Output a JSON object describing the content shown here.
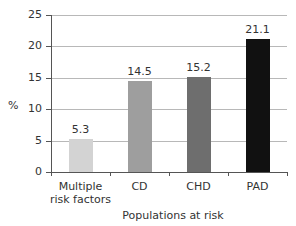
{
  "chart_data": {
    "type": "bar",
    "title": "",
    "xlabel": "Populations at risk",
    "ylabel": "%",
    "ylim": [
      0,
      25
    ],
    "yticks": [
      "0",
      "5",
      "10",
      "15",
      "20",
      "25"
    ],
    "grid": true,
    "categories": [
      "Multiple risk factors",
      "CD",
      "CHD",
      "PAD"
    ],
    "category_lines": [
      [
        "Multiple",
        "risk factors"
      ],
      [
        "CD"
      ],
      [
        "CHD"
      ],
      [
        "PAD"
      ]
    ],
    "values": [
      5.3,
      14.5,
      15.2,
      21.1
    ],
    "value_labels": [
      "5.3",
      "14.5",
      "15.2",
      "21.1"
    ],
    "colors": [
      "#d3d3d3",
      "#9e9e9e",
      "#6e6e6e",
      "#111111"
    ]
  }
}
